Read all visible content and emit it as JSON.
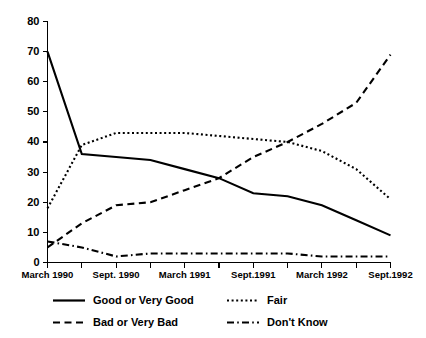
{
  "chart_data": {
    "type": "line",
    "title": "",
    "subtitle": "",
    "xlabel": "",
    "ylabel": "",
    "xlim": [
      0,
      10
    ],
    "ylim": [
      0,
      80
    ],
    "yticks": [
      0,
      10,
      20,
      30,
      40,
      50,
      60,
      70,
      80
    ],
    "ytick_labels": [
      "0",
      "10",
      "20",
      "30",
      "40",
      "50",
      "60",
      "70",
      "80"
    ],
    "x": [
      0,
      1,
      2,
      3,
      4,
      5,
      6,
      7,
      8,
      9,
      10
    ],
    "xtick_labels": [
      "March 1990",
      "",
      "Sept. 1990",
      "",
      "March 1991",
      "",
      "Sept.1991",
      "",
      "March 1992",
      "",
      "Sept.1992"
    ],
    "xtick_major": [
      "March 1990",
      "Sept. 1990",
      "March 1991",
      "Sept.1991",
      "March 1992",
      "Sept.1992"
    ],
    "grid": false,
    "legend_position": "bottom",
    "series": [
      {
        "name": "Good or Very Good",
        "style": "solid",
        "dash": "none",
        "values": [
          70,
          36,
          35,
          34,
          31,
          28,
          23,
          22,
          19,
          14,
          9
        ]
      },
      {
        "name": "Fair",
        "style": "dotted",
        "dash": "2,2.6",
        "values": [
          18,
          39,
          43,
          43,
          43,
          42,
          41,
          40,
          37,
          31,
          21
        ]
      },
      {
        "name": "Bad or Very Bad",
        "style": "dashed",
        "dash": "7,4.5",
        "values": [
          5,
          13,
          19,
          20,
          24,
          28,
          35,
          40,
          46,
          53,
          69
        ]
      },
      {
        "name": "Don't Know",
        "style": "dash-dot",
        "dash": "7,3.2,1.6,3.2",
        "values": [
          7,
          5,
          2,
          3,
          3,
          3,
          3,
          3,
          2,
          2,
          2
        ]
      }
    ]
  },
  "legend": {
    "entries": [
      {
        "label": "Good or Very Good",
        "style": "solid",
        "dash": "none"
      },
      {
        "label": "Fair",
        "style": "dotted",
        "dash": "2,2.6"
      },
      {
        "label": "Bad or Very Bad",
        "style": "dashed",
        "dash": "7,4.5"
      },
      {
        "label": "Don't Know",
        "style": "dash-dot",
        "dash": "7,3.2,1.6,3.2"
      }
    ]
  },
  "colors": {
    "ink": "#000000",
    "background": "#ffffff"
  }
}
